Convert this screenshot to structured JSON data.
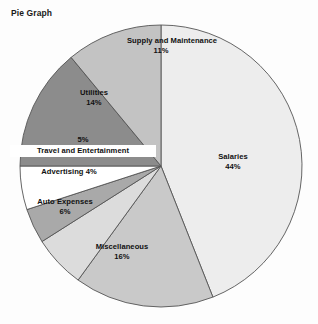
{
  "chart_data": {
    "type": "pie",
    "title": "Pie Graph",
    "xlabel": "",
    "ylabel": "",
    "legend_position": "none",
    "grid": false,
    "value_unit": "percent",
    "categories": [
      "Salaries",
      "Miscellaneous",
      "Auto Expenses",
      "Advertising",
      "Travel and Entertainment",
      "Utilities",
      "Supply and Maintenance"
    ],
    "values": [
      44,
      16,
      6,
      4,
      5,
      14,
      11
    ],
    "slices": [
      {
        "label": "Salaries",
        "value": 44,
        "value_label": "44%",
        "color": "#ededed",
        "label_placement": "inside"
      },
      {
        "label": "Miscellaneous",
        "value": 16,
        "value_label": "16%",
        "color": "#c9c9c9",
        "label_placement": "inside"
      },
      {
        "label": "Auto Expenses",
        "value": 6,
        "value_label": "6%",
        "color": "#dcdcdc",
        "label_placement": "inside"
      },
      {
        "label": "Advertising",
        "value": 4,
        "value_label": "4%",
        "color": "#a9a9a9",
        "label_placement": "inside-inline"
      },
      {
        "label": "Travel and Entertainment",
        "value": 5,
        "value_label": "5%",
        "color": "#ffffff",
        "label_placement": "outside"
      },
      {
        "label": "Utilities",
        "value": 14,
        "value_label": "14%",
        "color": "#8c8c8c",
        "label_placement": "inside"
      },
      {
        "label": "Supply and Maintenance",
        "value": 11,
        "value_label": "11%",
        "color": "#c3c3c3",
        "label_placement": "inside"
      }
    ],
    "style": {
      "outline_color": "#555555",
      "background": "#fdfdfd",
      "title_color": "#1a1a1a",
      "label_color": "#111111"
    }
  }
}
